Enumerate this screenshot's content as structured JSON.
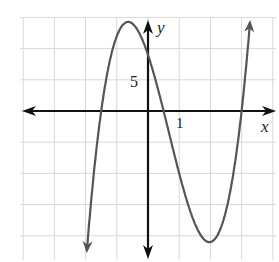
{
  "chart_data": {
    "type": "line",
    "title": "",
    "xlabel": "x",
    "ylabel": "y",
    "x_tick_label": "1",
    "y_tick_label": "5",
    "x_unit_per_grid": 1,
    "y_unit_per_grid": 5,
    "xlim": [
      -4,
      4
    ],
    "ylim": [
      -22,
      15
    ],
    "grid": true,
    "function": "y = 4(x + 1.5)(x - 0.5)(x - 3)",
    "roots": [
      -1.5,
      0.5,
      3
    ],
    "local_max": {
      "x": -0.7,
      "y": 14.2
    },
    "local_min": {
      "x": 2,
      "y": -21
    },
    "y_intercept": 9,
    "colors": {
      "curve": "#555555",
      "axes": "#111111",
      "grid": "#d8d8d8"
    }
  },
  "labels": {
    "x_axis": "x",
    "y_axis": "y",
    "x_tick": "1",
    "y_tick": "5"
  }
}
